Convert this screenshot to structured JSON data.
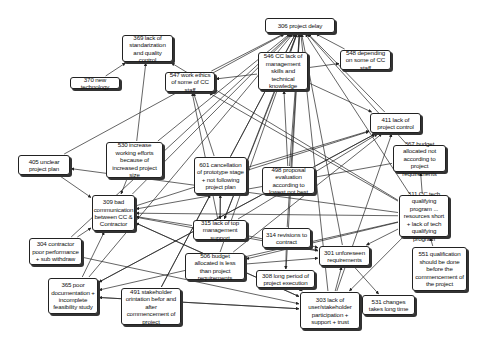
{
  "diagram": {
    "type": "cause-map",
    "nodes": [
      {
        "id": "306",
        "label": "306 project delay",
        "x": 265,
        "y": 18,
        "w": 70,
        "h": 15
      },
      {
        "id": "369",
        "label": "369 lack of standarization and quality control",
        "x": 122,
        "y": 35,
        "w": 51,
        "h": 27
      },
      {
        "id": "546",
        "label": "546 CC lack of management skills and technical knowledge",
        "x": 258,
        "y": 52,
        "w": 50,
        "h": 38
      },
      {
        "id": "548",
        "label": "548 depending on some of CC staff",
        "x": 340,
        "y": 50,
        "w": 51,
        "h": 20
      },
      {
        "id": "370",
        "label": "370 new technology",
        "x": 70,
        "y": 77,
        "w": 50,
        "h": 12
      },
      {
        "id": "547",
        "label": "547 work ethics of some of CC staff",
        "x": 165,
        "y": 72,
        "w": 50,
        "h": 20
      },
      {
        "id": "411",
        "label": "411 lack of project control",
        "x": 370,
        "y": 113,
        "w": 51,
        "h": 20
      },
      {
        "id": "405",
        "label": "405 unclear project plan",
        "x": 18,
        "y": 155,
        "w": 52,
        "h": 20
      },
      {
        "id": "530",
        "label": "530 increase working efforts because of increased project size",
        "x": 106,
        "y": 142,
        "w": 57,
        "h": 36
      },
      {
        "id": "601",
        "label": "601 cancellation of prototype stage + not following project plan",
        "x": 194,
        "y": 157,
        "w": 53,
        "h": 37
      },
      {
        "id": "498",
        "label": "498 proposal evaluation according to lowest not best",
        "x": 262,
        "y": 167,
        "w": 53,
        "h": 27
      },
      {
        "id": "367",
        "label": "367 budget allocated not according to project requirements",
        "x": 393,
        "y": 145,
        "w": 53,
        "h": 27
      },
      {
        "id": "309",
        "label": "309 bad communication between CC & Contractor",
        "x": 92,
        "y": 195,
        "w": 43,
        "h": 36
      },
      {
        "id": "311",
        "label": "311 CC tech qualifying program ... resources short + lack of tech qualifying program",
        "x": 399,
        "y": 195,
        "w": 50,
        "h": 42
      },
      {
        "id": "315",
        "label": "315 lack of top management support",
        "x": 193,
        "y": 220,
        "w": 54,
        "h": 20
      },
      {
        "id": "314",
        "label": "314 revisions to contract",
        "x": 262,
        "y": 228,
        "w": 49,
        "h": 20
      },
      {
        "id": "304",
        "label": "304 contractor poor performance + sub withdraw",
        "x": 29,
        "y": 238,
        "w": 53,
        "h": 27
      },
      {
        "id": "301",
        "label": "301 unforeseen requirements",
        "x": 319,
        "y": 246,
        "w": 51,
        "h": 20
      },
      {
        "id": "506",
        "label": "506 budget allocated is less than project requirements",
        "x": 185,
        "y": 253,
        "w": 60,
        "h": 27
      },
      {
        "id": "308",
        "label": "308 long period of project execution",
        "x": 256,
        "y": 270,
        "w": 59,
        "h": 18
      },
      {
        "id": "551",
        "label": "551 qualification should be done before the commencement of the project",
        "x": 412,
        "y": 247,
        "w": 55,
        "h": 44
      },
      {
        "id": "365",
        "label": "365 poor documentation + incomplete feasibility study",
        "x": 48,
        "y": 278,
        "w": 50,
        "h": 36
      },
      {
        "id": "491",
        "label": "491 stakeholder orintation befor and after commencement of project",
        "x": 121,
        "y": 288,
        "w": 60,
        "h": 37
      },
      {
        "id": "303",
        "label": "303 lack of user/stakeholder participation + support + trust",
        "x": 300,
        "y": 292,
        "w": 60,
        "h": 37
      },
      {
        "id": "531",
        "label": "531 changes takes long time",
        "x": 362,
        "y": 295,
        "w": 53,
        "h": 20
      }
    ],
    "edges": [
      [
        "546",
        "306"
      ],
      [
        "546",
        "548"
      ],
      [
        "548",
        "306"
      ],
      [
        "411",
        "306"
      ],
      [
        "547",
        "306"
      ],
      [
        "601",
        "306"
      ],
      [
        "498",
        "306"
      ],
      [
        "315",
        "306"
      ],
      [
        "314",
        "306"
      ],
      [
        "301",
        "306"
      ],
      [
        "308",
        "306"
      ],
      [
        "303",
        "306"
      ],
      [
        "309",
        "306"
      ],
      [
        "506",
        "306"
      ],
      [
        "367",
        "306"
      ],
      [
        "311",
        "306"
      ],
      [
        "530",
        "306"
      ],
      [
        "405",
        "306"
      ],
      [
        "491",
        "306"
      ],
      [
        "365",
        "306"
      ],
      [
        "304",
        "306"
      ],
      [
        "370",
        "369"
      ],
      [
        "530",
        "369"
      ],
      [
        "311",
        "369"
      ],
      [
        "546",
        "547"
      ],
      [
        "311",
        "547"
      ],
      [
        "601",
        "547"
      ],
      [
        "315",
        "547"
      ],
      [
        "311",
        "405"
      ],
      [
        "405",
        "309"
      ],
      [
        "546",
        "411"
      ],
      [
        "601",
        "411"
      ],
      [
        "498",
        "411"
      ],
      [
        "315",
        "411"
      ],
      [
        "309",
        "411"
      ],
      [
        "506",
        "411"
      ],
      [
        "303",
        "411"
      ],
      [
        "365",
        "411"
      ],
      [
        "311",
        "367"
      ],
      [
        "551",
        "311"
      ],
      [
        "315",
        "601"
      ],
      [
        "491",
        "601"
      ],
      [
        "304",
        "309"
      ],
      [
        "365",
        "309"
      ],
      [
        "315",
        "309"
      ],
      [
        "301",
        "309"
      ],
      [
        "303",
        "309"
      ],
      [
        "530",
        "309"
      ],
      [
        "311",
        "309"
      ],
      [
        "311",
        "365"
      ],
      [
        "303",
        "365"
      ],
      [
        "498",
        "365"
      ],
      [
        "311",
        "506"
      ],
      [
        "315",
        "301"
      ],
      [
        "314",
        "301"
      ],
      [
        "506",
        "301"
      ],
      [
        "311",
        "303"
      ],
      [
        "308",
        "303"
      ],
      [
        "531",
        "303"
      ],
      [
        "304",
        "303"
      ],
      [
        "365",
        "303"
      ],
      [
        "314",
        "308"
      ],
      [
        "301",
        "531"
      ],
      [
        "309",
        "303"
      ],
      [
        "601",
        "315"
      ],
      [
        "546",
        "315"
      ],
      [
        "303",
        "301"
      ],
      [
        "311",
        "301"
      ],
      [
        "367",
        "309"
      ],
      [
        "498",
        "546"
      ]
    ]
  }
}
